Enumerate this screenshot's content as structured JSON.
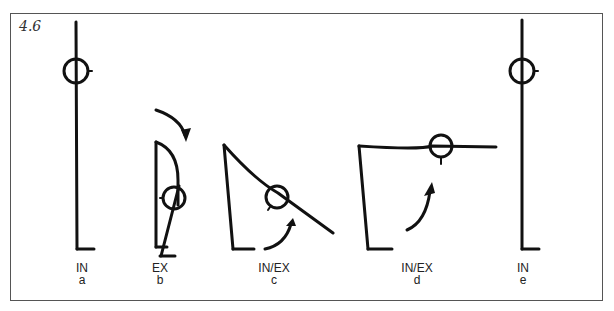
{
  "figure": {
    "number": "4.6",
    "panels": [
      {
        "id": "a",
        "mode": "IN",
        "letter": "a"
      },
      {
        "id": "b",
        "mode": "EX",
        "letter": "b"
      },
      {
        "id": "c",
        "mode": "IN/EX",
        "letter": "c"
      },
      {
        "id": "d",
        "mode": "IN/EX",
        "letter": "d"
      },
      {
        "id": "e",
        "mode": "IN",
        "letter": "e"
      }
    ]
  },
  "colors": {
    "ink": "#111111",
    "frame": "#555555"
  }
}
